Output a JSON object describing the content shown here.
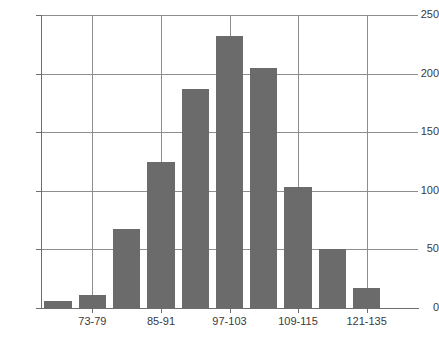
{
  "chart_data": {
    "type": "bar",
    "title": "",
    "subtitle": "",
    "xlabel": "",
    "ylabel": "",
    "categories": [
      "67-73",
      "73-79",
      "79-85",
      "85-91",
      "91-97",
      "97-103",
      "103-109",
      "109-115",
      "115-121",
      "121-135",
      "135-141"
    ],
    "values": [
      6,
      11,
      67,
      125,
      187,
      232,
      205,
      103,
      50,
      17,
      0
    ],
    "ylim": [
      0,
      250
    ],
    "yticks": [
      0,
      50,
      100,
      150,
      200,
      250
    ],
    "ytick_labels": [
      "0",
      "50",
      "100",
      "150",
      "200",
      "250"
    ],
    "visible_xtick_labels": [
      "73-79",
      "85-91",
      "97-103",
      "109-115",
      "121-135"
    ],
    "visible_xtick_indices": [
      1,
      3,
      5,
      7,
      9
    ],
    "grid": true,
    "legend": null,
    "bar_color": "#6b6b6b",
    "grid_color": "#8d8d8d",
    "axis_color": "#6e6e6e"
  },
  "caption": {
    "text": ""
  }
}
